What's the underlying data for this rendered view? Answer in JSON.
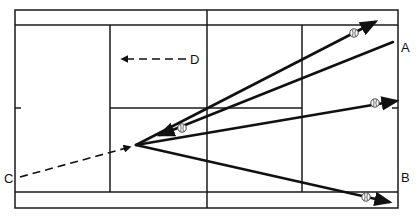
{
  "diagram": {
    "labels": {
      "a": "A",
      "b": "B",
      "c": "C",
      "d": "D"
    },
    "icons": {
      "ball": "tennis-ball-icon"
    },
    "shots": [
      {
        "name": "shot-to-top-doubles-alley",
        "style": "solid",
        "has_ball": true
      },
      {
        "name": "shot-from-a",
        "style": "solid",
        "has_ball": true
      },
      {
        "name": "shot-to-right-baseline",
        "style": "solid",
        "has_ball": true
      },
      {
        "name": "shot-to-bottom-doubles-alley",
        "style": "solid",
        "has_ball": true
      },
      {
        "name": "movement-from-c",
        "style": "dashed",
        "has_ball": false
      },
      {
        "name": "movement-d",
        "style": "dashed",
        "has_ball": false
      }
    ],
    "colors": {
      "line": "#111111",
      "background": "#ffffff"
    }
  }
}
